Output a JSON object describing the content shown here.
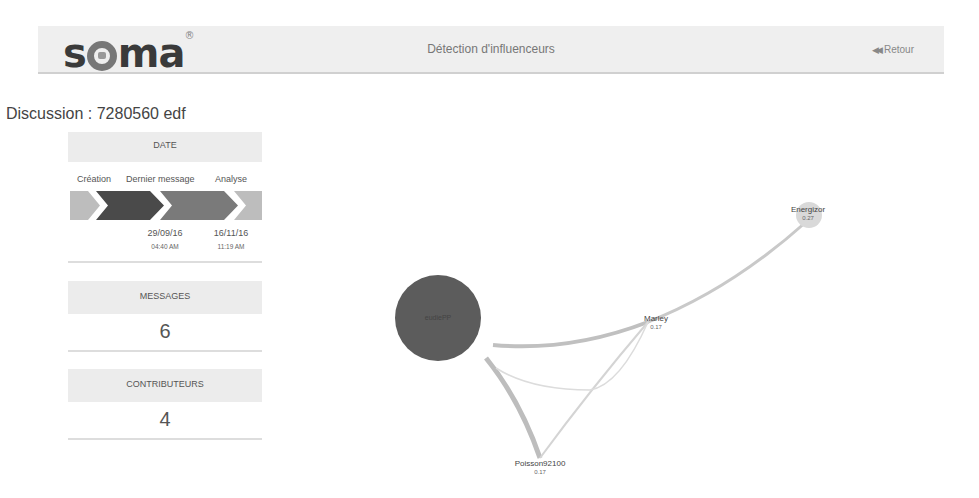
{
  "header": {
    "logo_text_s": "s",
    "logo_text_ma": "ma",
    "logo_mark": "®",
    "title": "Détection d'influenceurs",
    "back_icon": "double-chevron-left-icon",
    "back_glyph": "◀◀",
    "back_label": "Retour"
  },
  "discussion": {
    "title": "Discussion : 7280560 edf"
  },
  "date_card": {
    "heading": "DATE",
    "steps": [
      "Création",
      "Dernier message",
      "Analyse"
    ],
    "last_message": {
      "date": "29/09/16",
      "time": "04:40 AM"
    },
    "analysis": {
      "date": "16/11/16",
      "time": "11:19 AM"
    }
  },
  "messages_card": {
    "heading": "MESSAGES",
    "value": "6"
  },
  "contributors_card": {
    "heading": "CONTRIBUTEURS",
    "value": "4"
  },
  "graph": {
    "nodes": [
      {
        "id": "eudiePP",
        "label": "eudiePP",
        "score": "",
        "color": "#5c5c5c"
      },
      {
        "id": "Energizor",
        "label": "Energizor",
        "score": "0.27",
        "color": "#d6d6d6"
      },
      {
        "id": "Marley",
        "label": "Marley",
        "score": "0.17",
        "color": "#ffffff"
      },
      {
        "id": "Poisson92100",
        "label": "Poisson92100",
        "score": "0.17",
        "color": "#ffffff"
      }
    ],
    "edges": [
      {
        "from": "Marley",
        "to": "Energizor"
      },
      {
        "from": "eudiePP",
        "to": "Marley"
      },
      {
        "from": "eudiePP",
        "to": "Poisson92100"
      },
      {
        "from": "Poisson92100",
        "to": "Marley"
      },
      {
        "from": "eudiePP",
        "to": "Poisson92100",
        "thin": true
      }
    ],
    "edge_color": "#c8c8c8"
  }
}
